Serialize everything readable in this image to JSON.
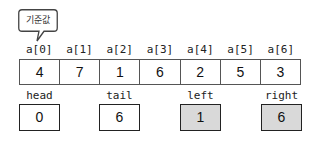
{
  "callout": {
    "label": "기준값",
    "points_to_index": 0
  },
  "array": {
    "indices": [
      "a[0]",
      "a[1]",
      "a[2]",
      "a[3]",
      "a[4]",
      "a[5]",
      "a[6]"
    ],
    "values": [
      "4",
      "7",
      "1",
      "6",
      "2",
      "5",
      "3"
    ]
  },
  "variables": [
    {
      "name": "head",
      "value": "0",
      "highlighted": false
    },
    {
      "name": "tail",
      "value": "6",
      "highlighted": false
    },
    {
      "name": "left",
      "value": "1",
      "highlighted": true
    },
    {
      "name": "right",
      "value": "6",
      "highlighted": true
    }
  ],
  "colors": {
    "highlight_fill": "#d9d9d9",
    "border": "#222222"
  }
}
